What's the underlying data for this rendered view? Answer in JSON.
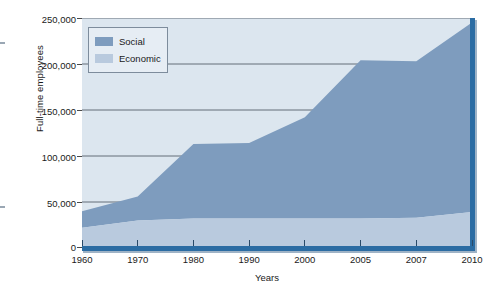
{
  "chart_data": {
    "type": "area",
    "stacked": true,
    "title": "",
    "xlabel": "Years",
    "ylabel": "Full-time employees",
    "categories": [
      "1960",
      "1970",
      "1980",
      "1990",
      "2000",
      "2005",
      "2007",
      "2010"
    ],
    "x_tick_labels": [
      "1960",
      "1970",
      "1980",
      "1990",
      "2000",
      "2005",
      "2007",
      "2010"
    ],
    "y_tick_labels": [
      "0",
      "50,000",
      "100,000",
      "150,000",
      "200,000",
      "250,000"
    ],
    "y_tick_values": [
      0,
      50000,
      100000,
      150000,
      200000,
      250000
    ],
    "ylim": [
      0,
      250000
    ],
    "grid": "horizontal",
    "legend_position": "top-left",
    "series": [
      {
        "name": "Economic",
        "color": "#b9cade",
        "values": [
          22000,
          30000,
          32000,
          32000,
          32000,
          32000,
          33000,
          39000
        ]
      },
      {
        "name": "Social",
        "color": "#7e9cbe",
        "values": [
          18000,
          26000,
          81000,
          82000,
          110000,
          172000,
          170000,
          206000
        ]
      }
    ],
    "totals": [
      40000,
      56000,
      113000,
      114000,
      142000,
      204000,
      203000,
      245000
    ],
    "colors": {
      "plot_background": "#dce6ef",
      "axis_band": "#2b6ca3",
      "gridline": "#55606b",
      "legend_background": "#e6edf4",
      "legend_border": "#7d8c9c",
      "text": "#1a1a1a"
    }
  },
  "legend": {
    "items": [
      {
        "label": "Social",
        "color": "#7e9cbe"
      },
      {
        "label": "Economic",
        "color": "#b9cade"
      }
    ]
  },
  "axes": {
    "y_title": "Full-time employees",
    "x_title": "Years"
  }
}
